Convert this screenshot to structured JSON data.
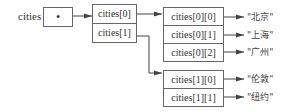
{
  "variable": {
    "name": "cities",
    "pointer_symbol": "•"
  },
  "outer_array": [
    {
      "label": "cities[0]"
    },
    {
      "label": "cities[1]"
    }
  ],
  "inner_arrays": [
    {
      "cells": [
        {
          "label": "cities[0][0]",
          "value": "\"北京\""
        },
        {
          "label": "cities[0][1]",
          "value": "\"上海\""
        },
        {
          "label": "cities[0][2]",
          "value": "\"广州\""
        }
      ]
    },
    {
      "cells": [
        {
          "label": "cities[1][0]",
          "value": "\"伦敦\""
        },
        {
          "label": "cities[1][1]",
          "value": "\"纽约\""
        }
      ]
    }
  ],
  "colors": {
    "line": "#444444",
    "border": "#666666",
    "text": "#333333"
  }
}
